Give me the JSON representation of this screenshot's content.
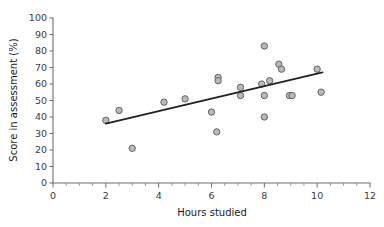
{
  "chart_data": {
    "type": "scatter",
    "title": "",
    "xlabel": "Hours studied",
    "ylabel": "Score in assessment (%)",
    "xlim": [
      0,
      12
    ],
    "ylim": [
      0,
      100
    ],
    "x_ticks": [
      0,
      2,
      4,
      6,
      8,
      10,
      12
    ],
    "x_tick_labels": [
      "0",
      "2",
      "4",
      "6",
      "8",
      "10",
      "12"
    ],
    "x_minor_tick_step": 0.5,
    "y_ticks": [
      0,
      10,
      20,
      30,
      40,
      50,
      60,
      70,
      80,
      90,
      100
    ],
    "y_tick_labels": [
      "0",
      "10",
      "20",
      "30",
      "40",
      "50",
      "60",
      "70",
      "80",
      "90",
      "100"
    ],
    "grid": false,
    "legend": "none",
    "marker": {
      "shape": "circle",
      "fill_color": "#b9b9b9",
      "edge_color": "#595959",
      "radius_px": 3.2
    },
    "points": [
      {
        "x": 2.0,
        "y": 38
      },
      {
        "x": 2.5,
        "y": 44
      },
      {
        "x": 3.0,
        "y": 21
      },
      {
        "x": 4.2,
        "y": 49
      },
      {
        "x": 5.0,
        "y": 51
      },
      {
        "x": 6.0,
        "y": 43
      },
      {
        "x": 6.2,
        "y": 31
      },
      {
        "x": 6.25,
        "y": 64
      },
      {
        "x": 6.25,
        "y": 62
      },
      {
        "x": 7.1,
        "y": 58
      },
      {
        "x": 7.1,
        "y": 53
      },
      {
        "x": 7.9,
        "y": 60
      },
      {
        "x": 8.0,
        "y": 83
      },
      {
        "x": 8.0,
        "y": 53
      },
      {
        "x": 8.0,
        "y": 40
      },
      {
        "x": 8.2,
        "y": 62
      },
      {
        "x": 8.55,
        "y": 72
      },
      {
        "x": 8.65,
        "y": 69
      },
      {
        "x": 8.95,
        "y": 53
      },
      {
        "x": 9.05,
        "y": 53
      },
      {
        "x": 10.0,
        "y": 69
      },
      {
        "x": 10.15,
        "y": 55
      }
    ],
    "trend_line": {
      "type": "linear-fit",
      "x_start": 2.0,
      "y_start": 36,
      "x_end": 10.2,
      "y_end": 67
    }
  }
}
